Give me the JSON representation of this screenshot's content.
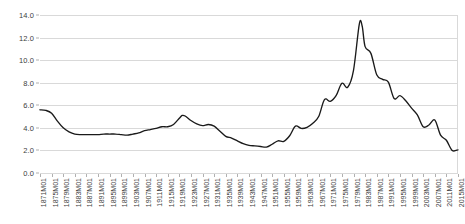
{
  "chart_data": {
    "type": "line",
    "title": "",
    "subtitle": "",
    "xlabel": "",
    "ylabel": "",
    "ylim": [
      0.0,
      14.0
    ],
    "ytick_step": 2.0,
    "grid": "horizontal",
    "legend": "none",
    "line_color": "#1a1a1a",
    "grid_color": "#d9d9d9",
    "y_ticks": [
      "0.0",
      "2.0",
      "4.0",
      "6.0",
      "8.0",
      "10.0",
      "12.0",
      "14.0"
    ],
    "x_tick_labels": [
      "1871M01",
      "1875M01",
      "1879M01",
      "1883M01",
      "1887M01",
      "1891M01",
      "1895M01",
      "1899M01",
      "1903M01",
      "1907M01",
      "1911M01",
      "1915M01",
      "1919M01",
      "1923M01",
      "1927M01",
      "1931M01",
      "1935M01",
      "1939M01",
      "1943M01",
      "1947M01",
      "1951M01",
      "1955M01",
      "1959M01",
      "1963M01",
      "1967M01",
      "1971M01",
      "1975M01",
      "1979M01",
      "1983M01",
      "1987M01",
      "1991M01",
      "1995M01",
      "1999M01",
      "2003M01",
      "2007M01",
      "2011M01",
      "2015M01"
    ],
    "series": [
      {
        "name": "Long-term interest rate",
        "x": [
          1871,
          1873,
          1875,
          1877,
          1879,
          1881,
          1883,
          1885,
          1887,
          1889,
          1891,
          1893,
          1895,
          1897,
          1899,
          1901,
          1903,
          1905,
          1907,
          1909,
          1911,
          1913,
          1915,
          1917,
          1919,
          1920,
          1921,
          1923,
          1925,
          1927,
          1929,
          1931,
          1933,
          1935,
          1937,
          1939,
          1941,
          1943,
          1945,
          1947,
          1949,
          1951,
          1953,
          1955,
          1957,
          1959,
          1961,
          1963,
          1965,
          1967,
          1969,
          1971,
          1973,
          1975,
          1977,
          1979,
          1981,
          1982,
          1983,
          1985,
          1987,
          1989,
          1991,
          1993,
          1995,
          1997,
          1999,
          2001,
          2003,
          2005,
          2007,
          2009,
          2011,
          2013,
          2015
        ],
        "values": [
          5.6,
          5.55,
          5.3,
          4.6,
          4.0,
          3.65,
          3.45,
          3.4,
          3.4,
          3.4,
          3.4,
          3.45,
          3.45,
          3.45,
          3.4,
          3.35,
          3.45,
          3.55,
          3.75,
          3.85,
          3.95,
          4.1,
          4.1,
          4.3,
          4.85,
          5.1,
          5.05,
          4.65,
          4.35,
          4.2,
          4.3,
          4.15,
          3.7,
          3.25,
          3.1,
          2.85,
          2.6,
          2.45,
          2.4,
          2.35,
          2.3,
          2.55,
          2.85,
          2.8,
          3.3,
          4.15,
          3.95,
          4.05,
          4.4,
          5.0,
          6.5,
          6.35,
          6.85,
          7.95,
          7.6,
          9.1,
          13.2,
          13.0,
          11.2,
          10.6,
          8.7,
          8.3,
          8.05,
          6.6,
          6.85,
          6.4,
          5.75,
          5.15,
          4.1,
          4.25,
          4.7,
          3.35,
          2.9,
          2.0,
          2.05
        ]
      }
    ]
  }
}
